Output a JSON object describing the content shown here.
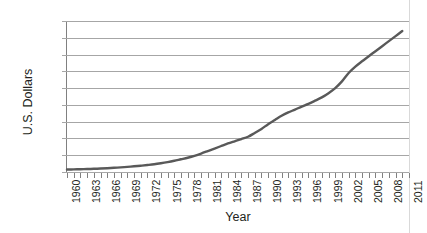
{
  "chart_data": {
    "type": "line",
    "title": "",
    "xlabel": "Year",
    "ylabel": "U.S. Dollars",
    "xlim": [
      1960,
      2011
    ],
    "ylim": [
      0,
      9000
    ],
    "grid": true,
    "legend": "none",
    "y_ticks": [
      0,
      1000,
      2000,
      3000,
      4000,
      5000,
      6000,
      7000,
      8000,
      9000
    ],
    "y_tick_labels": [
      "0",
      "1000",
      "2000",
      "3000",
      "4000",
      "5000",
      "6000",
      "7000",
      "8000",
      "9000"
    ],
    "x_tick_labels": [
      "1960",
      "1963",
      "1966",
      "1969",
      "1972",
      "1975",
      "1978",
      "1981",
      "1984",
      "1987",
      "1990",
      "1993",
      "1996",
      "1999",
      "2002",
      "2005",
      "2008",
      "2011"
    ],
    "x_tick_label_step": 3,
    "x_minor_tick_step": 1,
    "line_color": "#595959",
    "line_width": 2.4,
    "series": [
      {
        "name": "U.S. Dollars",
        "x": [
          1960,
          1961,
          1962,
          1963,
          1964,
          1965,
          1966,
          1967,
          1968,
          1969,
          1970,
          1971,
          1972,
          1973,
          1974,
          1975,
          1976,
          1977,
          1978,
          1979,
          1980,
          1981,
          1982,
          1983,
          1984,
          1985,
          1986,
          1987,
          1988,
          1989,
          1990,
          1991,
          1992,
          1993,
          1994,
          1995,
          1996,
          1997,
          1998,
          1999,
          2000,
          2001,
          2002,
          2003,
          2004,
          2005,
          2006,
          2007,
          2008,
          2009,
          2010
        ],
        "values": [
          147,
          155,
          165,
          175,
          190,
          205,
          225,
          250,
          275,
          305,
          340,
          375,
          415,
          460,
          520,
          590,
          670,
          760,
          850,
          960,
          1100,
          1250,
          1400,
          1550,
          1700,
          1830,
          1960,
          2100,
          2330,
          2570,
          2850,
          3100,
          3350,
          3550,
          3720,
          3900,
          4060,
          4250,
          4450,
          4700,
          5000,
          5400,
          5900,
          6280,
          6600,
          6900,
          7200,
          7500,
          7800,
          8100,
          8400
        ]
      }
    ]
  },
  "axes": {
    "y_title": "U.S. Dollars",
    "x_title": "Year"
  }
}
